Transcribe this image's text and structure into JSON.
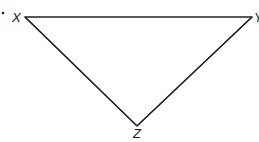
{
  "diagram": {
    "type": "triangle",
    "stroke_color": "#222222",
    "background": "#ffffff",
    "bullet": "•",
    "vertices": [
      {
        "label": "X",
        "x": 25,
        "y": 17
      },
      {
        "label": "Y",
        "x": 252,
        "y": 17
      },
      {
        "label": "Z",
        "x": 137,
        "y": 126
      }
    ],
    "labels": {
      "x": "X",
      "y": "Y",
      "z": "Z"
    }
  }
}
